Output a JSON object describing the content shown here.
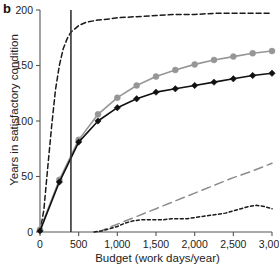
{
  "panel": {
    "label": "b"
  },
  "chart_data": {
    "type": "line",
    "title": "",
    "xlabel": "Budget (work days/year)",
    "ylabel": "Years in satisfactory condition",
    "xlim": [
      0,
      3000
    ],
    "ylim": [
      0,
      200
    ],
    "xticks": [
      0,
      500,
      1000,
      1500,
      2000,
      2500,
      3000
    ],
    "xticklabels": [
      "0",
      "500",
      "1,000",
      "1,500",
      "2,000",
      "2,500",
      "3,000"
    ],
    "yticks": [
      0,
      50,
      100,
      150,
      200
    ],
    "yticklabels": [
      "0",
      "50",
      "100",
      "150",
      "200"
    ],
    "grid": false,
    "legend": "none",
    "annotations": [
      {
        "name": "current-budget-line",
        "type": "vline",
        "x": 400,
        "color": "#333333"
      }
    ],
    "series": [
      {
        "name": "top-dashed-curve",
        "style": "dashed",
        "color": "#1a1a1a",
        "marker": "none",
        "x": [
          0,
          50,
          100,
          150,
          200,
          250,
          300,
          350,
          400,
          500,
          600,
          750,
          900,
          1000,
          1250,
          1500,
          1750,
          2000,
          2250,
          2500,
          2750,
          3000
        ],
        "y": [
          0,
          20,
          58,
          95,
          128,
          150,
          165,
          174,
          180,
          186,
          189,
          191,
          192,
          193,
          194,
          195,
          196,
          196,
          197,
          197,
          197,
          197
        ]
      },
      {
        "name": "gray-marker-curve",
        "style": "solid",
        "color": "#969696",
        "marker": "circle",
        "x": [
          0,
          250,
          500,
          750,
          1000,
          1250,
          1500,
          1750,
          2000,
          2250,
          2500,
          2750,
          3000
        ],
        "y": [
          2,
          47,
          83,
          106,
          121,
          132,
          140,
          146,
          151,
          155,
          158,
          161,
          163
        ]
      },
      {
        "name": "black-marker-curve",
        "style": "solid",
        "color": "#111111",
        "marker": "diamond",
        "x": [
          0,
          250,
          500,
          750,
          1000,
          1250,
          1500,
          1750,
          2000,
          2250,
          2500,
          2750,
          3000
        ],
        "y": [
          1,
          45,
          81,
          100,
          112,
          120,
          126,
          129,
          132,
          135,
          138,
          141,
          143
        ]
      },
      {
        "name": "gray-long-dashed-line",
        "style": "long-dashed",
        "color": "#8c8c8c",
        "marker": "none",
        "x": [
          750,
          1000,
          1250,
          1500,
          1750,
          2000,
          2250,
          2500,
          2750,
          3000
        ],
        "y": [
          0,
          7,
          14,
          21,
          28,
          35,
          42,
          49,
          55,
          62
        ]
      },
      {
        "name": "black-short-dashed-line",
        "style": "short-dashed",
        "color": "#1a1a1a",
        "marker": "none",
        "x": [
          700,
          800,
          900,
          1000,
          1100,
          1200,
          1300,
          1400,
          1500,
          1600,
          1700,
          1800,
          1900,
          2000,
          2100,
          2200,
          2300,
          2400,
          2500,
          2600,
          2700,
          2800,
          2900,
          3000
        ],
        "y": [
          0,
          1,
          3,
          5,
          8,
          10,
          11,
          11,
          11,
          11,
          12,
          12,
          12,
          13,
          14,
          15,
          16,
          17,
          19,
          21,
          23,
          24,
          23,
          21
        ]
      }
    ]
  }
}
